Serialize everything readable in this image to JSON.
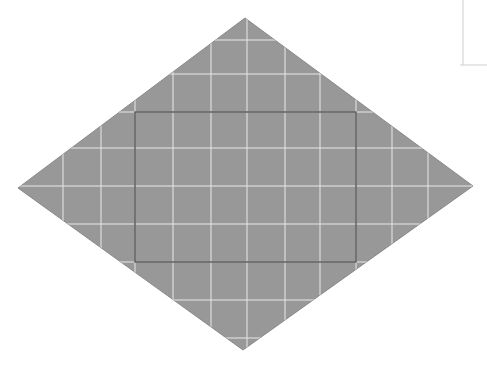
{
  "canvas": {
    "width": 487,
    "height": 367,
    "background_color": "#ffffff",
    "title": "Shaded rhombus with inscribed rectangle on square grid"
  },
  "colors": {
    "shape_fill": "#989898",
    "shape_stroke": "#8a8a8a",
    "grid_line": "#e8e8e8",
    "rectangle_stroke": "#4a4a4a",
    "corner_mark": "#cfcfcf",
    "background": "#ffffff"
  },
  "rhombus": {
    "label": "shaded-rhombus",
    "fill_color": "#989898",
    "stroke_color": "#8a8a8a",
    "stroke_width": 1,
    "vertices": [
      {
        "name": "top",
        "x": 245,
        "y": 18
      },
      {
        "name": "right",
        "x": 473,
        "y": 186
      },
      {
        "name": "bottom",
        "x": 243,
        "y": 350
      },
      {
        "name": "left",
        "x": 18,
        "y": 188
      }
    ],
    "points_attr": "245,18 473,186 243,350 18,188",
    "width_px": 455,
    "height_px": 332
  },
  "inner_rectangle": {
    "label": "inscribed-rectangle",
    "stroke_color": "#4a4a4a",
    "stroke_width": 1.3,
    "fill": "none",
    "x": 135,
    "y": 112,
    "width": 221,
    "height": 150,
    "corners": [
      {
        "name": "top-left",
        "x": 135,
        "y": 112
      },
      {
        "name": "top-right",
        "x": 356,
        "y": 112
      },
      {
        "name": "bottom-right",
        "x": 356,
        "y": 262
      },
      {
        "name": "bottom-left",
        "x": 135,
        "y": 262
      }
    ]
  },
  "grid": {
    "label": "square-grid-overlay",
    "line_color": "#e8e8e8",
    "line_width": 1,
    "spacing_px": 38,
    "vertical_x": [
      63,
      101,
      135,
      173,
      211,
      247,
      285,
      320,
      356,
      392,
      428
    ],
    "horizontal_y": [
      40,
      74,
      112,
      148,
      186,
      224,
      262,
      300,
      338
    ]
  },
  "corner_mark": {
    "label": "top-right-corner-mark",
    "stroke_color": "#cfcfcf",
    "stroke_width": 1,
    "vertical_x": 463,
    "vertical_y_start": 0,
    "vertical_y_end": 65,
    "horizontal_y": 65,
    "horizontal_x_start": 460,
    "horizontal_x_end": 487
  }
}
